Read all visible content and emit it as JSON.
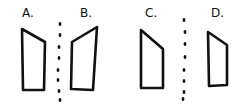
{
  "diagram": {
    "type": "symmetry-reflection-puzzle",
    "options": [
      {
        "label": "A.",
        "label_pos": [
          22,
          8
        ],
        "shape_points": [
          [
            22,
            29
          ],
          [
            45,
            42
          ],
          [
            44,
            90
          ],
          [
            23,
            90
          ]
        ]
      },
      {
        "label": "B.",
        "label_pos": [
          80,
          8
        ],
        "shape_points": [
          [
            72,
            42
          ],
          [
            97,
            27
          ],
          [
            93,
            90
          ],
          [
            71,
            89
          ]
        ]
      },
      {
        "label": "C.",
        "label_pos": [
          145,
          8
        ],
        "shape_points": [
          [
            141,
            30
          ],
          [
            163,
            49
          ],
          [
            163,
            88
          ],
          [
            141,
            88
          ]
        ]
      },
      {
        "label": "D.",
        "label_pos": [
          211,
          8
        ],
        "shape_points": [
          [
            208,
            32
          ],
          [
            227,
            45
          ],
          [
            227,
            85
          ],
          [
            209,
            86
          ]
        ]
      }
    ],
    "mirror_lines": [
      {
        "name": "dotted-line-left",
        "dots": [
          [
            60,
            24
          ],
          [
            60,
            35
          ],
          [
            59,
            47
          ],
          [
            59,
            58
          ],
          [
            58,
            70
          ],
          [
            58,
            80
          ],
          [
            59,
            91
          ],
          [
            60,
            100
          ]
        ]
      },
      {
        "name": "dotted-line-right",
        "dots": [
          [
            184,
            20
          ],
          [
            185,
            32
          ],
          [
            185,
            44
          ],
          [
            185,
            57
          ],
          [
            184,
            70
          ],
          [
            184,
            81
          ],
          [
            184,
            92
          ],
          [
            183,
            99
          ]
        ]
      }
    ],
    "colors": {
      "stroke": "#111111",
      "background": "#ffffff"
    }
  }
}
